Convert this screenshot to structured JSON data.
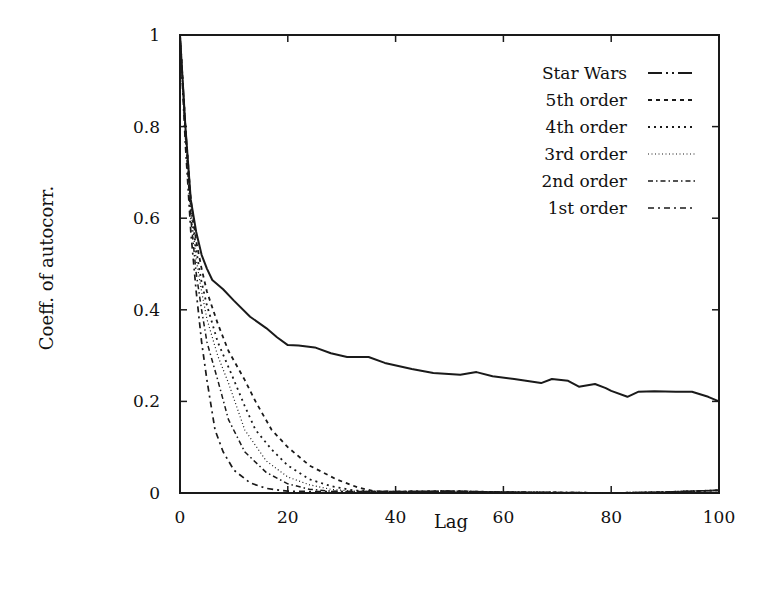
{
  "chart_data": {
    "type": "line",
    "title": "",
    "xlabel": "Lag",
    "ylabel": "Coeff. of autocorr.",
    "xlim": [
      0,
      100
    ],
    "ylim": [
      0,
      1
    ],
    "xticks": [
      0,
      20,
      40,
      60,
      80,
      100
    ],
    "xtick_labels": [
      "0",
      "20",
      "40",
      "60",
      "80",
      "100"
    ],
    "yticks": [
      0,
      0.2,
      0.4,
      0.6,
      0.8,
      1
    ],
    "ytick_labels": [
      "0",
      "0.2",
      "0.4",
      "0.6",
      "0.8",
      "1"
    ],
    "grid": false,
    "legend_position": "upper right",
    "series": [
      {
        "name": "Star Wars",
        "style": "dash-dot",
        "x": [
          0,
          1,
          2,
          3,
          4,
          5,
          6,
          8,
          10,
          13,
          16,
          18,
          20,
          22,
          25,
          28,
          31,
          35,
          38,
          43,
          47,
          52,
          55,
          58,
          62,
          67,
          69,
          72,
          74,
          77,
          79,
          80,
          83,
          85,
          88,
          92,
          95,
          98,
          100
        ],
        "y": [
          1.0,
          0.8,
          0.64,
          0.57,
          0.52,
          0.49,
          0.465,
          0.445,
          0.42,
          0.385,
          0.36,
          0.34,
          0.323,
          0.322,
          0.318,
          0.305,
          0.297,
          0.297,
          0.284,
          0.271,
          0.262,
          0.258,
          0.264,
          0.255,
          0.249,
          0.24,
          0.249,
          0.245,
          0.232,
          0.238,
          0.229,
          0.223,
          0.21,
          0.221,
          0.222,
          0.221,
          0.221,
          0.21,
          0.2
        ]
      },
      {
        "name": "5th order",
        "style": "dashed",
        "x": [
          0,
          1,
          2,
          3,
          4,
          5,
          7,
          9,
          12,
          14,
          17,
          20,
          24,
          29,
          33,
          36,
          40,
          50,
          60,
          70,
          80,
          90,
          100
        ],
        "y": [
          1.0,
          0.8,
          0.64,
          0.55,
          0.49,
          0.44,
          0.37,
          0.31,
          0.247,
          0.2,
          0.138,
          0.1,
          0.06,
          0.03,
          0.012,
          0.004,
          0.003,
          0.004,
          0.002,
          0.001,
          0.0,
          0.002,
          0.006
        ]
      },
      {
        "name": "4th order",
        "style": "dotted",
        "x": [
          0,
          1,
          2,
          3,
          4,
          5,
          7,
          10,
          12,
          14,
          17,
          20,
          24,
          28,
          32,
          36,
          40,
          50,
          60,
          70,
          80,
          90,
          100
        ],
        "y": [
          1.0,
          0.8,
          0.63,
          0.53,
          0.46,
          0.41,
          0.33,
          0.247,
          0.19,
          0.138,
          0.095,
          0.06,
          0.03,
          0.015,
          0.006,
          0.003,
          0.003,
          0.004,
          0.002,
          0.001,
          0.0,
          0.002,
          0.006
        ]
      },
      {
        "name": "3rd order",
        "style": "fine-dotted",
        "x": [
          0,
          1,
          2,
          3,
          4,
          5,
          7,
          9,
          12,
          16,
          20,
          24,
          28,
          32,
          36,
          40,
          50,
          60,
          70,
          80,
          90,
          100
        ],
        "y": [
          1.0,
          0.79,
          0.62,
          0.51,
          0.44,
          0.38,
          0.3,
          0.24,
          0.138,
          0.07,
          0.035,
          0.018,
          0.008,
          0.004,
          0.003,
          0.003,
          0.004,
          0.002,
          0.001,
          0.0,
          0.002,
          0.006
        ]
      },
      {
        "name": "2nd order",
        "style": "dash-dot-fine",
        "x": [
          0,
          1,
          2,
          3,
          4,
          5,
          7,
          9,
          12,
          16,
          20,
          24,
          28,
          32,
          36,
          40,
          50,
          60,
          70,
          80,
          90,
          100
        ],
        "y": [
          1.0,
          0.78,
          0.6,
          0.48,
          0.4,
          0.33,
          0.247,
          0.16,
          0.09,
          0.045,
          0.02,
          0.008,
          0.004,
          0.003,
          0.003,
          0.003,
          0.004,
          0.002,
          0.001,
          0.0,
          0.002,
          0.006
        ]
      },
      {
        "name": "1st order",
        "style": "long-dash-dot",
        "x": [
          0,
          1,
          2,
          3,
          4,
          5,
          6.5,
          8,
          10,
          13,
          16,
          20,
          25,
          30,
          40,
          50,
          60,
          70,
          80,
          90,
          100
        ],
        "y": [
          1.0,
          0.76,
          0.57,
          0.44,
          0.33,
          0.247,
          0.138,
          0.09,
          0.05,
          0.022,
          0.01,
          0.004,
          0.003,
          0.003,
          0.003,
          0.004,
          0.002,
          0.001,
          0.0,
          0.002,
          0.006
        ]
      }
    ]
  },
  "legend": {
    "items": [
      {
        "label": "Star Wars"
      },
      {
        "label": "5th order"
      },
      {
        "label": "4th order"
      },
      {
        "label": "3rd order"
      },
      {
        "label": "2nd order"
      },
      {
        "label": "1st order"
      }
    ]
  },
  "colors": {
    "ink": "#1a1a1a",
    "background": "#ffffff"
  }
}
